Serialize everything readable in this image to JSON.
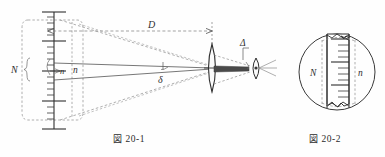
{
  "figure": {
    "type": "optical-diagram",
    "background": "#fefefe",
    "ink": "#3a3a3a",
    "page_width": 385,
    "page_height": 157
  },
  "fig1": {
    "caption_jp": "図",
    "caption_num": "20-1",
    "labels": {
      "scale_total": "N",
      "scale_subdivision_a": "n",
      "scale_subdivision_b": "n",
      "distance": "D",
      "angle": "δ",
      "aperture": "Δ"
    },
    "elements": {
      "ruler": "vertical-scale",
      "field_of_view": "dashed-rounded-rect",
      "lens": "convex-lens",
      "eye": "eye-lens",
      "rays": "dashed-cone"
    }
  },
  "fig2": {
    "caption_jp": "図",
    "caption_num": "20-2",
    "labels": {
      "field_circle": "N",
      "scale_marks": "n"
    },
    "elements": {
      "circle": "field-of-view-circle",
      "ruler": "vertical-scale-strip"
    }
  }
}
